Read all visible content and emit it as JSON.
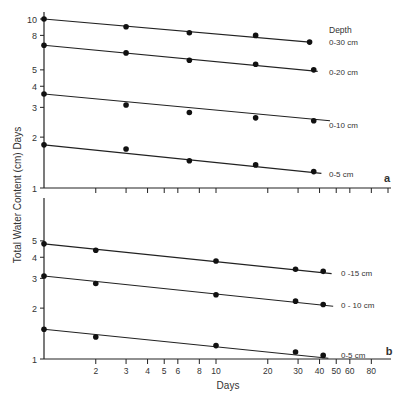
{
  "figure": {
    "ylabel": "Total Water Content (cm)  Days",
    "xlabel": "Days",
    "legend_title": "Depth"
  },
  "chart_data": [
    {
      "panel": "a",
      "type": "line",
      "x_scale": "log",
      "y_scale": "log",
      "xlabel": "Days",
      "ylabel": "Total Water Content (cm)",
      "xlim": [
        1,
        100
      ],
      "ylim": [
        1,
        11
      ],
      "y_ticks": [
        1,
        2,
        3,
        4,
        5,
        8,
        10
      ],
      "x_ticks": [
        2,
        3,
        4,
        5,
        6,
        8,
        10,
        20,
        30,
        40,
        50,
        60,
        80,
        100
      ],
      "x_tick_labels_shown": false,
      "grid": false,
      "legend_title": "Depth",
      "series": [
        {
          "name": "0-30 cm",
          "x": [
            1,
            3,
            7,
            17,
            35
          ],
          "y": [
            10.0,
            9.0,
            8.3,
            8.0,
            7.3
          ],
          "fit": {
            "x": [
              1,
              35
            ],
            "y": [
              10.0,
              7.3
            ]
          }
        },
        {
          "name": "0-20 cm",
          "x": [
            1,
            3,
            7,
            17,
            37
          ],
          "y": [
            7.0,
            6.3,
            5.7,
            5.4,
            5.0
          ],
          "fit": {
            "x": [
              1,
              39
            ],
            "y": [
              7.0,
              4.9
            ]
          }
        },
        {
          "name": "0-10 cm",
          "x": [
            1,
            3,
            7,
            17,
            37
          ],
          "y": [
            3.6,
            3.1,
            2.8,
            2.6,
            2.5
          ],
          "fit": {
            "x": [
              1,
              46
            ],
            "y": [
              3.6,
              2.5
            ]
          }
        },
        {
          "name": "0-5 cm",
          "x": [
            1,
            3,
            7,
            17,
            37
          ],
          "y": [
            1.8,
            1.7,
            1.45,
            1.37,
            1.25
          ],
          "fit": {
            "x": [
              1,
              41
            ],
            "y": [
              1.8,
              1.22
            ]
          }
        }
      ]
    },
    {
      "panel": "b",
      "type": "line",
      "x_scale": "log",
      "y_scale": "log",
      "xlabel": "Days",
      "ylabel": "Total Water Content (cm)",
      "xlim": [
        1,
        100
      ],
      "ylim": [
        1,
        9
      ],
      "y_ticks": [
        1,
        2,
        3,
        4,
        5
      ],
      "x_ticks": [
        2,
        3,
        4,
        5,
        6,
        8,
        10,
        20,
        30,
        40,
        50,
        60,
        80
      ],
      "x_tick_labels_shown": true,
      "grid": false,
      "series": [
        {
          "name": "0 -15 cm",
          "x": [
            1,
            2,
            10,
            29,
            42
          ],
          "y": [
            4.8,
            4.4,
            3.8,
            3.4,
            3.3
          ],
          "fit": {
            "x": [
              1,
              47
            ],
            "y": [
              4.8,
              3.2
            ]
          }
        },
        {
          "name": "0 - 10 cm",
          "x": [
            1,
            2,
            10,
            29,
            42
          ],
          "y": [
            3.1,
            2.8,
            2.4,
            2.2,
            2.1
          ],
          "fit": {
            "x": [
              1,
              48
            ],
            "y": [
              3.1,
              2.05
            ]
          }
        },
        {
          "name": "0-5 cm",
          "x": [
            1,
            2,
            10,
            29,
            42
          ],
          "y": [
            1.5,
            1.35,
            1.2,
            1.1,
            1.05
          ],
          "fit": {
            "x": [
              1,
              45
            ],
            "y": [
              1.5,
              1.01
            ]
          }
        }
      ]
    }
  ],
  "panels": {
    "a": {
      "letter": "a"
    },
    "b": {
      "letter": "b"
    }
  }
}
